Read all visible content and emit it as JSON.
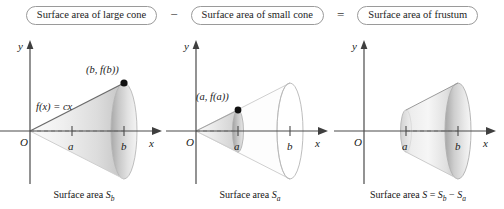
{
  "equation_row": {
    "term1": "Surface area of large cone",
    "operator1": "−",
    "term2": "Surface area of small cone",
    "operator2": "=",
    "term3": "Surface area of frustum"
  },
  "panels": [
    {
      "id": "large-cone",
      "y_axis_label": "y",
      "x_axis_label": "x",
      "origin_label": "O",
      "tick_a": "a",
      "tick_b": "b",
      "point_label": "(b, f(b))",
      "function_label": "f(x) = cx",
      "caption_prefix": "Surface area ",
      "caption_symbol": "S",
      "caption_subscript": "b"
    },
    {
      "id": "small-cone",
      "y_axis_label": "y",
      "x_axis_label": "x",
      "origin_label": "O",
      "tick_a": "a",
      "tick_b": "b",
      "point_label": "(a, f(a))",
      "function_label": "",
      "caption_prefix": "Surface area ",
      "caption_symbol": "S",
      "caption_subscript": "a"
    },
    {
      "id": "frustum",
      "y_axis_label": "y",
      "x_axis_label": "x",
      "origin_label": "O",
      "tick_a": "a",
      "tick_b": "b",
      "point_label": "",
      "function_label": "",
      "caption_prefix": "Surface area ",
      "caption_symbol": "S",
      "caption_subscript": ""
    }
  ],
  "frustum_caption": {
    "prefix": "Surface area ",
    "s": "S",
    "eq": " = ",
    "sb": "S",
    "sb_sub": "b",
    "minus": " − ",
    "sa": "S",
    "sa_sub": "a"
  },
  "colors": {
    "axis": "#3f3f3f",
    "cone_light": "#f2f2f2",
    "cone_mid": "#d8d8d8",
    "cone_dark": "#b9b9b9",
    "outline": "#8d8d8d",
    "box_border": "#9a9a9a",
    "text": "#1a1a1a",
    "dot": "#111111"
  },
  "geometry": {
    "origin_x": 30,
    "axis_y": 103,
    "a_x": 72,
    "b_x": 124,
    "x_axis_end": 160,
    "y_axis_top": 14,
    "cone_half_height_at_b": 48,
    "cone_half_height_at_a": 20,
    "ellipse_rx_b": 13,
    "ellipse_rx_a": 5.5
  }
}
